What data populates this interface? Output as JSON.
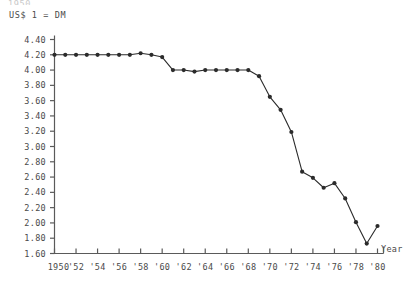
{
  "chart_data": {
    "type": "line",
    "title": "",
    "ylabel": "US$ 1 = DM",
    "xlabel": "Year",
    "ylim": [
      1.6,
      4.4
    ],
    "ytick_step": 0.2,
    "xlim": [
      1950,
      1980
    ],
    "xtick_step": 2,
    "grid": false,
    "legend": null,
    "marker": "filled-circle",
    "line_color": "#2b2b2b",
    "axis_color": "#5a5a5a",
    "ytick_labels": [
      "4.40",
      "4.20",
      "4.00",
      "3.80",
      "3.60",
      "3.40",
      "3.20",
      "3.00",
      "2.80",
      "2.60",
      "2.40",
      "2.20",
      "2.00",
      "1.80",
      "1.60"
    ],
    "ytick_values": [
      4.4,
      4.2,
      4.0,
      3.8,
      3.6,
      3.4,
      3.2,
      3.0,
      2.8,
      2.6,
      2.4,
      2.2,
      2.0,
      1.8,
      1.6
    ],
    "xtick_labels": [
      "1950",
      "'52",
      "'54",
      "'56",
      "'58",
      "'60",
      "'62",
      "'64",
      "'66",
      "'68",
      "'70",
      "'72",
      "'74",
      "'76",
      "'78",
      "'80"
    ],
    "xtick_values": [
      1950,
      1952,
      1954,
      1956,
      1958,
      1960,
      1962,
      1964,
      1966,
      1968,
      1970,
      1972,
      1974,
      1976,
      1978,
      1980
    ],
    "x": [
      1950,
      1951,
      1952,
      1953,
      1954,
      1955,
      1956,
      1957,
      1958,
      1959,
      1960,
      1961,
      1962,
      1963,
      1964,
      1965,
      1966,
      1967,
      1968,
      1969,
      1970,
      1971,
      1972,
      1973,
      1974,
      1975,
      1976,
      1977,
      1978,
      1979,
      1980
    ],
    "values": [
      4.2,
      4.2,
      4.2,
      4.2,
      4.2,
      4.2,
      4.2,
      4.2,
      4.22,
      4.2,
      4.17,
      4.0,
      4.0,
      3.98,
      4.0,
      4.0,
      4.0,
      4.0,
      4.0,
      3.92,
      3.65,
      3.48,
      3.19,
      2.67,
      2.59,
      2.46,
      2.52,
      2.32,
      2.01,
      1.73,
      1.96
    ],
    "top_clipped_text": "1950"
  },
  "axis_title_y": "US$ 1 = DM",
  "axis_title_x": "Year"
}
